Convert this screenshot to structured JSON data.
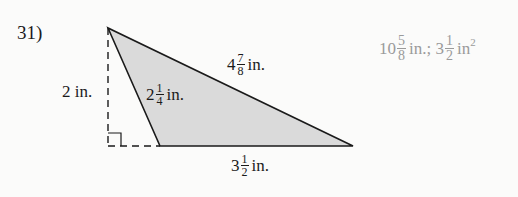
{
  "problem": {
    "number": "31)",
    "figure": {
      "type": "obtuse-triangle-with-height",
      "fill_color": "#d9d9d9",
      "labels": {
        "height": {
          "whole": "2",
          "unit": "in."
        },
        "left_side": {
          "whole": "2",
          "num": "1",
          "den": "4",
          "unit": "in."
        },
        "top_side": {
          "whole": "4",
          "num": "7",
          "den": "8",
          "unit": "in."
        },
        "base": {
          "whole": "3",
          "num": "1",
          "den": "2",
          "unit": "in."
        }
      }
    },
    "answer": {
      "perimeter": {
        "whole": "10",
        "num": "5",
        "den": "8",
        "unit": "in.;"
      },
      "area": {
        "whole": "3",
        "num": "1",
        "den": "2",
        "unit": "in",
        "exp": "2"
      }
    }
  }
}
